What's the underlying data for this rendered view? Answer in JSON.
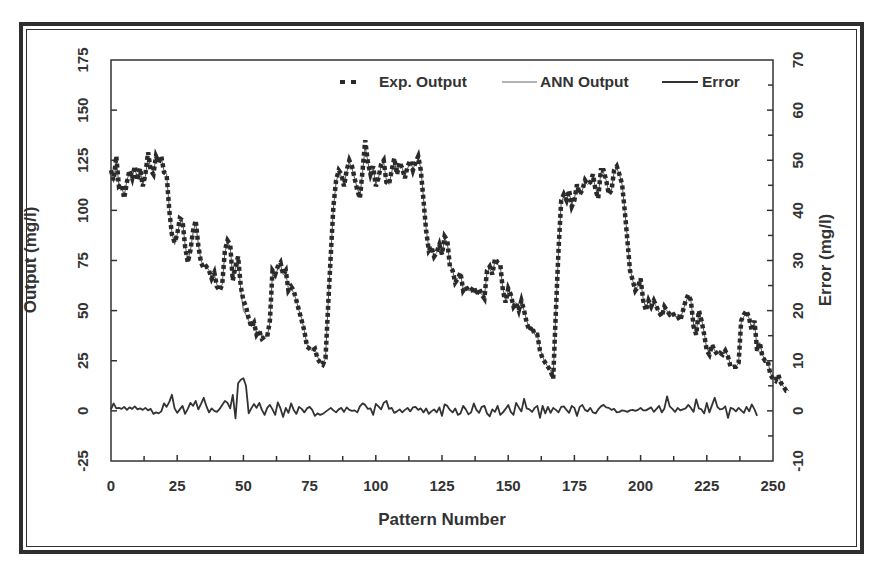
{
  "chart_data": {
    "type": "line",
    "title": "",
    "xlabel": "Pattern Number",
    "ylabel": "Output (mg/l)",
    "y2label": "Error (mg/l)",
    "xlim": [
      0,
      250
    ],
    "ylim": [
      -25,
      175
    ],
    "y2lim": [
      -10,
      70
    ],
    "xticks": [
      0,
      25,
      50,
      75,
      100,
      125,
      150,
      175,
      200,
      225,
      250
    ],
    "yticks": [
      -25,
      0,
      25,
      50,
      75,
      100,
      125,
      150,
      175
    ],
    "y2ticks": [
      -10,
      0,
      10,
      20,
      30,
      40,
      50,
      60,
      70
    ],
    "grid": false,
    "legend_position": "top-right",
    "legend": [
      {
        "label": "Exp. Output",
        "style": "dashed-thick"
      },
      {
        "label": "ANN Output",
        "style": "thin-solid"
      },
      {
        "label": "Error",
        "style": "solid"
      }
    ],
    "series": [
      {
        "name": "Exp. Output",
        "axis": "left",
        "x_start": 0,
        "x_step": 1,
        "values": [
          120,
          115,
          127,
          112,
          113,
          106,
          114,
          120,
          116,
          122,
          115,
          121,
          112,
          118,
          129,
          120,
          118,
          127,
          124,
          127,
          119,
          118,
          100,
          88,
          84,
          88,
          96,
          95,
          82,
          74,
          80,
          90,
          95,
          82,
          74,
          71,
          72,
          70,
          66,
          69,
          62,
          60,
          63,
          80,
          85,
          83,
          65,
          72,
          77,
          62,
          55,
          52,
          46,
          42,
          44,
          38,
          40,
          36,
          37,
          37,
          45,
          70,
          68,
          72,
          74,
          68,
          70,
          60,
          62,
          60,
          55,
          50,
          45,
          40,
          32,
          31,
          30,
          31,
          26,
          24,
          23,
          26,
          52,
          78,
          102,
          115,
          120,
          118,
          112,
          120,
          125,
          122,
          116,
          110,
          106,
          120,
          135,
          124,
          118,
          122,
          112,
          116,
          123,
          125,
          114,
          113,
          120,
          126,
          118,
          124,
          121,
          116,
          122,
          125,
          120,
          124,
          127,
          120,
          105,
          90,
          80,
          82,
          77,
          79,
          83,
          78,
          87,
          85,
          72,
          70,
          64,
          66,
          69,
          60,
          62,
          60,
          60,
          62,
          58,
          61,
          58,
          56,
          70,
          72,
          68,
          76,
          74,
          73,
          60,
          54,
          61,
          58,
          52,
          54,
          50,
          55,
          50,
          44,
          40,
          42,
          38,
          38,
          30,
          26,
          24,
          22,
          20,
          16,
          50,
          80,
          105,
          108,
          105,
          110,
          102,
          105,
          113,
          108,
          110,
          115,
          113,
          114,
          118,
          110,
          106,
          120,
          120,
          115,
          108,
          110,
          120,
          122,
          118,
          113,
          100,
          85,
          70,
          65,
          60,
          62,
          66,
          55,
          50,
          55,
          52,
          55,
          52,
          49,
          47,
          52,
          50,
          48,
          49,
          47,
          47,
          45,
          50,
          55,
          58,
          55,
          42,
          38,
          50,
          45,
          38,
          30,
          28,
          33,
          30,
          28,
          29,
          28,
          30,
          27,
          22,
          22,
          22,
          24,
          45,
          48,
          50,
          46,
          40,
          45,
          30,
          34,
          27,
          25,
          25,
          18,
          16,
          15,
          18,
          14,
          12,
          10,
          10
        ]
      },
      {
        "name": "ANN Output",
        "axis": "left",
        "x_start": 0,
        "x_step": 1,
        "values": [
          118,
          114,
          125,
          113,
          112,
          107,
          115,
          119,
          117,
          121,
          116,
          120,
          113,
          117,
          127,
          121,
          119,
          126,
          124,
          126,
          120,
          118,
          101,
          89,
          83,
          88,
          94,
          95,
          83,
          75,
          80,
          89,
          94,
          83,
          75,
          72,
          72,
          70,
          67,
          68,
          63,
          61,
          63,
          79,
          84,
          82,
          66,
          71,
          76,
          60,
          50,
          48,
          45,
          42,
          44,
          39,
          40,
          37,
          37,
          37,
          44,
          69,
          67,
          71,
          73,
          68,
          69,
          61,
          61,
          59,
          55,
          50,
          46,
          40,
          33,
          31,
          30,
          31,
          27,
          24,
          24,
          26,
          53,
          78,
          101,
          114,
          119,
          117,
          113,
          119,
          124,
          121,
          116,
          111,
          107,
          119,
          132,
          124,
          118,
          121,
          113,
          116,
          122,
          124,
          115,
          113,
          119,
          125,
          118,
          123,
          121,
          117,
          121,
          124,
          121,
          123,
          126,
          121,
          106,
          91,
          81,
          82,
          77,
          79,
          82,
          78,
          86,
          84,
          73,
          70,
          65,
          66,
          68,
          61,
          62,
          60,
          60,
          61,
          58,
          60,
          58,
          57,
          69,
          71,
          68,
          75,
          73,
          72,
          61,
          55,
          60,
          58,
          53,
          54,
          51,
          54,
          50,
          45,
          41,
          42,
          38,
          38,
          31,
          27,
          24,
          22,
          20,
          17,
          50,
          79,
          104,
          107,
          106,
          109,
          103,
          106,
          112,
          108,
          110,
          114,
          113,
          114,
          117,
          111,
          107,
          119,
          119,
          115,
          109,
          110,
          119,
          121,
          118,
          113,
          101,
          86,
          71,
          65,
          61,
          62,
          65,
          56,
          51,
          55,
          52,
          54,
          52,
          49,
          48,
          51,
          50,
          48,
          49,
          47,
          47,
          46,
          50,
          54,
          57,
          55,
          43,
          39,
          49,
          46,
          39,
          31,
          29,
          33,
          30,
          29,
          29,
          28,
          30,
          27,
          23,
          22,
          22,
          24,
          44,
          47,
          49,
          46,
          41,
          44,
          31,
          34,
          28,
          25,
          25,
          19,
          16,
          16,
          18,
          14,
          12,
          11,
          10
        ]
      },
      {
        "name": "Error",
        "axis": "right",
        "x_start": 0,
        "x_step": 1,
        "values": [
          0.3,
          1.5,
          0.5,
          0.6,
          0.4,
          0.8,
          0.2,
          0.7,
          0.4,
          0.9,
          0.3,
          0.5,
          0.2,
          0.6,
          0.1,
          0.4,
          -0.6,
          -0.3,
          -0.5,
          -0.1,
          1.5,
          0.8,
          1.8,
          3.2,
          0.5,
          -0.4,
          0.3,
          1.0,
          -0.6,
          0.4,
          1.6,
          1.0,
          2.0,
          0.3,
          1.4,
          2.6,
          1.0,
          -0.3,
          0.5,
          0.0,
          -0.2,
          0.4,
          1.2,
          2.0,
          1.6,
          0.5,
          3.2,
          -1.5,
          5.5,
          6.2,
          6.5,
          5.0,
          -0.5,
          0.5,
          1.4,
          0.6,
          1.6,
          0.2,
          -0.8,
          0.6,
          1.2,
          0.3,
          -0.8,
          1.7,
          0.5,
          -1.2,
          0.6,
          -0.4,
          1.5,
          0.2,
          -0.6,
          0.8,
          0.4,
          -0.3,
          0.5,
          0.8,
          0.2,
          -1.0,
          -0.5,
          -0.8,
          -0.6,
          -0.2,
          0.2,
          0.6,
          0.1,
          -0.3,
          0.3,
          0.6,
          -0.2,
          0.7,
          0.2,
          0.0,
          0.1,
          -0.3,
          0.9,
          1.5,
          1.2,
          0.4,
          0.5,
          -0.8,
          1.4,
          0.9,
          0.3,
          1.6,
          2.0,
          0.4,
          0.6,
          -0.4,
          -0.1,
          0.3,
          -0.3,
          0.2,
          0.6,
          -0.1,
          0.7,
          0.8,
          0.2,
          0.5,
          -0.3,
          0.5,
          -0.6,
          -0.1,
          0.3,
          -0.3,
          0.7,
          -1.0,
          1.3,
          1.0,
          0.2,
          -0.3,
          0.5,
          -0.8,
          -0.5,
          1.0,
          0.3,
          -0.7,
          -0.3,
          1.5,
          0.2,
          -0.4,
          0.8,
          1.0,
          -0.5,
          -1.1,
          0.3,
          -0.2,
          1.0,
          -0.8,
          -0.3,
          0.4,
          1.2,
          -0.2,
          -0.8,
          1.6,
          0.7,
          -0.1,
          2.4,
          0.5,
          0.3,
          -0.2,
          0.6,
          1.0,
          -1.4,
          1.0,
          -0.5,
          0.8,
          -0.4,
          0.6,
          0.2,
          -0.3,
          0.8,
          0.9,
          0.2,
          -0.4,
          1.0,
          0.6,
          -1.0,
          0.8,
          1.2,
          0.2,
          -0.1,
          0.6,
          -0.3,
          -0.5,
          0.3,
          0.9,
          1.2,
          0.7,
          0.6,
          0.2,
          0.4,
          -0.3,
          -0.2,
          0.1,
          0.0,
          -0.2,
          0.1,
          0.2,
          0.0,
          0.2,
          0.6,
          0.1,
          0.1,
          0.4,
          0.7,
          -0.2,
          0.4,
          1.0,
          -0.3,
          0.5,
          2.9,
          0.9,
          0.4,
          -0.2,
          0.6,
          0.1,
          0.3,
          0.5,
          1.2,
          0.6,
          -0.2,
          2.3,
          0.5,
          0.3,
          -0.5,
          1.6,
          -0.3,
          1.2,
          2.6,
          0.8,
          0.3,
          0.4,
          0.9,
          -1.4,
          0.6,
          0.4,
          -0.1,
          0.6,
          0.1,
          -0.4,
          0.8,
          -0.1,
          1.3,
          0.3,
          -1.0
        ]
      }
    ]
  },
  "legend": {
    "exp_output_label": "Exp. Output",
    "ann_output_label": "ANN Output",
    "error_label": "Error"
  },
  "axes": {
    "x_title": "Pattern Number",
    "y_left_title": "Output (mg/l)",
    "y_right_title": "Error (mg/l)"
  },
  "colors": {
    "line": "#333333",
    "frame": "#2e2e2e",
    "background": "#ffffff"
  }
}
